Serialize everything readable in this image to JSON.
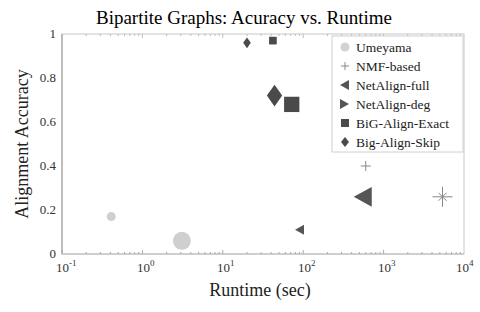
{
  "chart_data": {
    "type": "scatter",
    "title": "Bipartite Graphs: Acuracy vs. Runtime",
    "xlabel": "Runtime (sec)",
    "ylabel": "Alignment Accuracy",
    "xscale": "log",
    "xlim": [
      0.1,
      10000
    ],
    "ylim": [
      0,
      1
    ],
    "xticks": [
      "10^-1",
      "10^0",
      "10^1",
      "10^2",
      "10^3",
      "10^4"
    ],
    "yticks": [
      "0",
      "0.2",
      "0.4",
      "0.6",
      "0.8",
      "1"
    ],
    "grid": false,
    "legend_position": "upper right",
    "series": [
      {
        "name": "Umeyama",
        "marker": "circle",
        "color": "#cfcfcf",
        "points": [
          {
            "x": 0.41,
            "y": 0.17,
            "size": "small"
          },
          {
            "x": 3.1,
            "y": 0.06,
            "size": "large"
          }
        ]
      },
      {
        "name": "NMF-based",
        "marker": "plus-star",
        "color": "#888888",
        "points": [
          {
            "x": 600,
            "y": 0.4,
            "size": "small"
          },
          {
            "x": 5400,
            "y": 0.26,
            "size": "large"
          }
        ]
      },
      {
        "name": "NetAlign-full",
        "marker": "triangle-left",
        "color": "#555555",
        "points": [
          {
            "x": 90,
            "y": 0.11,
            "size": "small"
          },
          {
            "x": 550,
            "y": 0.26,
            "size": "large"
          }
        ]
      },
      {
        "name": "NetAlign-deg",
        "marker": "triangle-right",
        "color": "#555555",
        "points": []
      },
      {
        "name": "BiG-Align-Exact",
        "marker": "square",
        "color": "#4a4a4a",
        "points": [
          {
            "x": 42,
            "y": 0.97,
            "size": "small"
          },
          {
            "x": 72,
            "y": 0.68,
            "size": "large"
          }
        ]
      },
      {
        "name": "Big-Align-Skip",
        "marker": "diamond",
        "color": "#4a4a4a",
        "points": [
          {
            "x": 20,
            "y": 0.96,
            "size": "small"
          },
          {
            "x": 44,
            "y": 0.72,
            "size": "large"
          }
        ]
      }
    ]
  },
  "legend": {
    "items": [
      "Umeyama",
      "NMF-based",
      "NetAlign-full",
      "NetAlign-deg",
      "BiG-Align-Exact",
      "Big-Align-Skip"
    ]
  },
  "axis": {
    "x_tick_base": "10",
    "x_tick_exps": [
      "-1",
      "0",
      "1",
      "2",
      "3",
      "4"
    ],
    "y_tick_labels": [
      "0",
      "0.2",
      "0.4",
      "0.6",
      "0.8",
      "1"
    ]
  }
}
